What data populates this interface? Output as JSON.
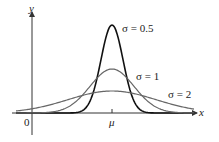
{
  "chart_data": {
    "type": "line",
    "title": "",
    "xlabel": "x",
    "ylabel": "y",
    "tick_labels": {
      "origin": "0",
      "mean": "μ"
    },
    "grid": false,
    "legend": "inline annotations",
    "series": [
      {
        "name": "σ = 0.5",
        "sigma": 0.5,
        "color": "#111111",
        "stroke_width": 1.6
      },
      {
        "name": "σ = 1",
        "sigma": 1,
        "color": "#666666",
        "stroke_width": 1.2
      },
      {
        "name": "σ = 2",
        "sigma": 2,
        "color": "#666666",
        "stroke_width": 1.2
      }
    ]
  },
  "labels": {
    "y_axis": "y",
    "x_axis": "x",
    "origin": "0",
    "mu": "μ",
    "s05": "σ = 0.5",
    "s1": "σ = 1",
    "s2": "σ = 2"
  }
}
